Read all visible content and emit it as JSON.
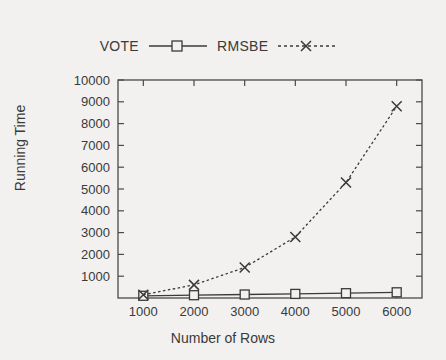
{
  "chart_data": {
    "type": "line",
    "title": "",
    "xlabel": "Number of Rows",
    "ylabel": "Running Time",
    "x": [
      1000,
      2000,
      3000,
      4000,
      5000,
      6000
    ],
    "xlim": [
      500,
      6500
    ],
    "ylim": [
      0,
      10000
    ],
    "xticks": [
      "1000",
      "2000",
      "3000",
      "4000",
      "5000",
      "6000"
    ],
    "yticks": [
      "1000",
      "2000",
      "3000",
      "4000",
      "5000",
      "6000",
      "7000",
      "8000",
      "9000",
      "10000"
    ],
    "grid": false,
    "legend_position": "top-center",
    "series": [
      {
        "name": "VOTE",
        "values": [
          100,
          130,
          160,
          190,
          220,
          260
        ],
        "line_style": "solid",
        "marker": "open-square",
        "color": "#3a3a3a"
      },
      {
        "name": "RMSBE",
        "values": [
          150,
          600,
          1400,
          2800,
          5300,
          8800
        ],
        "line_style": "dotted",
        "marker": "cross-x",
        "color": "#3a3a3a"
      }
    ]
  },
  "legend": {
    "entries": [
      {
        "label": "VOTE"
      },
      {
        "label": "RMSBE"
      }
    ]
  },
  "axes": {
    "x_title": "Number of Rows",
    "y_title": "Running Time"
  },
  "colors": {
    "background": "#f2f1ef",
    "ink": "#3a3a3a",
    "frame": "#4a4a4a"
  }
}
